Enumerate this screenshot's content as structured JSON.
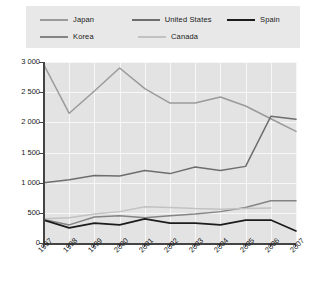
{
  "legend": {
    "rows": [
      [
        {
          "label": "Japan",
          "color": "#9a9a9a"
        },
        {
          "label": "United States",
          "color": "#6e6e6e"
        },
        {
          "label": "Spain",
          "color": "#1c1c1c"
        }
      ],
      [
        {
          "label": "Korea",
          "color": "#848484"
        },
        {
          "label": "Canada",
          "color": "#c2c2c2"
        }
      ]
    ]
  },
  "chart_data": {
    "type": "line",
    "title": "",
    "xlabel": "",
    "ylabel": "",
    "x": [
      "1997",
      "1998",
      "1999",
      "2000",
      "2001",
      "2002",
      "2003",
      "2004",
      "2005",
      "2006",
      "2007"
    ],
    "ylim": [
      0,
      3000
    ],
    "yticks": [
      0,
      500,
      1000,
      1500,
      2000,
      2500,
      3000
    ],
    "ytick_labels": [
      "0",
      "500",
      "1 000",
      "1 500",
      "2 000",
      "2 500",
      "3 000"
    ],
    "grid": true,
    "legend_position": "top",
    "series": [
      {
        "name": "Japan",
        "color": "#9a9a9a",
        "values": [
          2950,
          2150,
          2520,
          2900,
          2560,
          2320,
          2320,
          2420,
          2270,
          2060,
          1850
        ]
      },
      {
        "name": "United States",
        "color": "#6e6e6e",
        "values": [
          1000,
          1050,
          1120,
          1110,
          1200,
          1150,
          1260,
          1200,
          1270,
          2100,
          2050
        ]
      },
      {
        "name": "Korea",
        "color": "#848484",
        "values": [
          390,
          300,
          430,
          450,
          420,
          450,
          480,
          520,
          590,
          700,
          700
        ]
      },
      {
        "name": "Canada",
        "color": "#c2c2c2",
        "values": [
          400,
          420,
          480,
          520,
          600,
          590,
          570,
          560,
          570,
          580,
          null
        ]
      },
      {
        "name": "Spain",
        "color": "#1c1c1c",
        "values": [
          380,
          250,
          330,
          300,
          400,
          330,
          330,
          300,
          380,
          380,
          200
        ]
      }
    ]
  }
}
